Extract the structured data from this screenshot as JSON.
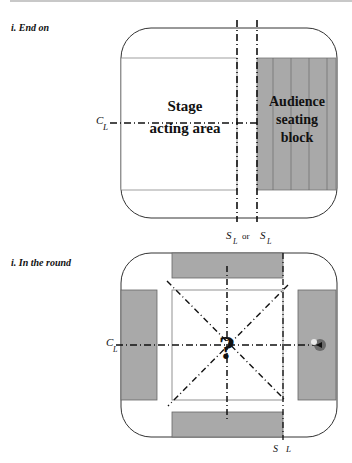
{
  "figures": [
    {
      "caption": "i. End on",
      "stage_label_line1": "Stage",
      "stage_label_line2": "acting area",
      "audience_label_line1": "Audience",
      "audience_label_line2": "seating",
      "audience_label_line3": "block",
      "centre_line_label": "C",
      "centre_line_sub": "L",
      "setting_line_label_left": "S",
      "setting_line_sub_left": "L",
      "or_text": "or",
      "setting_line_label_right": "S",
      "setting_line_sub_right": "L"
    },
    {
      "caption": "i. In the round",
      "centre_symbol": "?",
      "centre_line_label": "C",
      "centre_line_sub": "L",
      "setting_line_label": "S",
      "setting_line_sub": "L"
    }
  ],
  "colors": {
    "seating_fill": "#a9a9a9",
    "outline": "#333333",
    "line": "#111111"
  }
}
